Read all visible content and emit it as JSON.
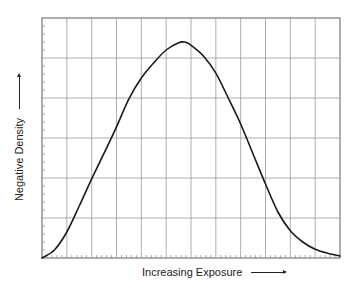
{
  "chart_data": {
    "type": "line",
    "title": "",
    "xlabel": "Increasing Exposure",
    "ylabel": "Negative Density",
    "x_arrow": true,
    "y_arrow": true,
    "xlim": [
      0,
      12
    ],
    "ylim": [
      0,
      6
    ],
    "grid": true,
    "grid_columns": 12,
    "grid_rows": 6,
    "minor_ticks_per_cell_x": 5,
    "minor_ticks_per_cell_y": 5,
    "tick_labels": false,
    "legend": null,
    "series": [
      {
        "name": "density curve",
        "color": "#1a1a1a",
        "x": [
          0,
          0.5,
          1.0,
          1.5,
          2.0,
          2.5,
          3.0,
          3.5,
          4.0,
          4.5,
          5.0,
          5.5,
          5.75,
          6.0,
          6.5,
          7.0,
          7.5,
          8.0,
          8.5,
          9.0,
          9.5,
          10.0,
          10.5,
          11.0,
          11.5,
          12.0
        ],
        "y": [
          0.0,
          0.2,
          0.65,
          1.3,
          1.98,
          2.62,
          3.28,
          3.98,
          4.5,
          4.88,
          5.2,
          5.38,
          5.4,
          5.32,
          5.05,
          4.62,
          4.0,
          3.35,
          2.6,
          1.85,
          1.15,
          0.68,
          0.4,
          0.22,
          0.12,
          0.05
        ]
      }
    ]
  },
  "labels": {
    "y_axis": "Negative Density",
    "x_axis": "Increasing Exposure"
  },
  "colors": {
    "grid": "#9a9a9a",
    "frame": "#8c8c8c",
    "curve": "#1a1a1a",
    "text": "#222222"
  }
}
